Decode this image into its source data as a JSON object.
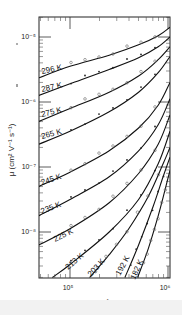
{
  "chart_data": {
    "type": "line",
    "title": "",
    "xlabel": "E (V cm^-1)",
    "ylabel": "μ (cm^2 V^-1 s^-1)",
    "xscale": "log",
    "yscale": "log",
    "xlim": [
      47863,
      1100000
    ],
    "ylim": [
      2e-09,
      2e-05
    ],
    "x_ticks": [
      {
        "value": 100000,
        "label": "10^5"
      },
      {
        "value": 1000000,
        "label": "10^6"
      }
    ],
    "y_ticks": [
      {
        "value": 1e-05,
        "label": "10^-5"
      },
      {
        "value": 1e-06,
        "label": "10^-6"
      },
      {
        "value": 1e-07,
        "label": "10^-7"
      },
      {
        "value": 1e-08,
        "label": "10^-8"
      }
    ],
    "grid": false,
    "legend": "inline curve labels",
    "series": [
      {
        "name": "296 K",
        "logE": [
          4.68,
          5.0,
          5.4,
          5.7,
          5.9,
          6.02
        ],
        "logMu": [
          -5.63,
          -5.45,
          -5.28,
          -5.12,
          -4.98,
          -4.85
        ]
      },
      {
        "name": "287 K",
        "logE": [
          4.68,
          5.0,
          5.4,
          5.7,
          5.9,
          6.02
        ],
        "logMu": [
          -5.9,
          -5.72,
          -5.5,
          -5.32,
          -5.15,
          -5.0
        ]
      },
      {
        "name": "275 K",
        "logE": [
          4.68,
          5.0,
          5.4,
          5.7,
          5.9,
          6.02
        ],
        "logMu": [
          -6.3,
          -6.1,
          -5.85,
          -5.6,
          -5.35,
          -5.15
        ]
      },
      {
        "name": "265 K",
        "logE": [
          4.68,
          5.0,
          5.4,
          5.7,
          5.9,
          6.02
        ],
        "logMu": [
          -6.65,
          -6.45,
          -6.15,
          -5.85,
          -5.55,
          -5.3
        ]
      },
      {
        "name": "245 K",
        "logE": [
          4.68,
          5.0,
          5.4,
          5.7,
          5.9,
          6.02
        ],
        "logMu": [
          -7.3,
          -7.08,
          -6.75,
          -6.4,
          -6.05,
          -5.7
        ]
      },
      {
        "name": "235 K",
        "logE": [
          4.68,
          5.0,
          5.4,
          5.7,
          5.9,
          6.02
        ],
        "logMu": [
          -7.75,
          -7.5,
          -7.15,
          -6.75,
          -6.35,
          -5.95
        ]
      },
      {
        "name": "225 K",
        "logE": [
          4.68,
          5.0,
          5.4,
          5.7,
          5.9,
          6.02
        ],
        "logMu": [
          -8.2,
          -7.95,
          -7.55,
          -7.1,
          -6.65,
          -6.2
        ]
      },
      {
        "name": "213 K",
        "logE": [
          4.82,
          5.0,
          5.4,
          5.7,
          5.9,
          6.02
        ],
        "logMu": [
          -8.7,
          -8.5,
          -8.0,
          -7.5,
          -6.95,
          -6.45
        ]
      },
      {
        "name": "203 K",
        "logE": [
          5.2,
          5.4,
          5.6,
          5.8,
          5.95,
          6.02
        ],
        "logMu": [
          -8.7,
          -8.35,
          -7.95,
          -7.45,
          -6.95,
          -6.7
        ]
      },
      {
        "name": "192 K",
        "logE": [
          5.56,
          5.7,
          5.85,
          5.95,
          6.02
        ],
        "logMu": [
          -8.7,
          -8.2,
          -7.6,
          -7.15,
          -6.85
        ]
      },
      {
        "name": "182 K",
        "logE": [
          5.69,
          5.8,
          5.9,
          5.97,
          6.02
        ],
        "logMu": [
          -8.7,
          -8.25,
          -7.75,
          -7.35,
          -7.05
        ]
      }
    ],
    "markers": {
      "open_circles": "experimental data (odd curves)",
      "filled_dots": "experimental data (even curves)"
    }
  },
  "labels": {
    "x_axis_title": "E  (V cm⁻¹)",
    "y_axis_title": "μ  (cm² V⁻¹ s⁻¹)",
    "y_tick_1": "10⁻⁵",
    "y_tick_2": "10⁻⁶",
    "y_tick_3": "10⁻⁷",
    "y_tick_4": "10⁻⁸",
    "x_tick_1": "10⁵",
    "x_tick_2": "10⁶",
    "curves": [
      "296 K",
      "287 K",
      "275 K",
      "265 K",
      "245 K",
      "235 K",
      "225 K",
      "213 K",
      "203 K",
      "192 K",
      "182 K"
    ]
  }
}
